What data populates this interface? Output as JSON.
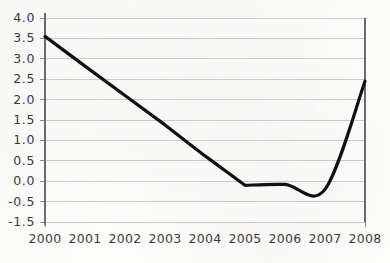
{
  "chart_data": {
    "type": "line",
    "title": "",
    "subtitle": "",
    "xlabel": "",
    "ylabel": "",
    "grid": true,
    "legend": false,
    "legend_position": "none",
    "x": [
      2000,
      2001,
      2002,
      2003,
      2004,
      2005,
      2006,
      2007,
      2008
    ],
    "xtick_labels": [
      "2000",
      "2001",
      "2002",
      "2003",
      "2004",
      "2005",
      "2006",
      "2007",
      "2008"
    ],
    "xlim": [
      2000,
      2008
    ],
    "ylim": [
      -1.5,
      4.0
    ],
    "ytick_values": [
      4.0,
      3.5,
      3.0,
      2.5,
      2.0,
      1.5,
      1.0,
      0.5,
      0.0,
      -0.5,
      -1.5
    ],
    "ytick_labels": [
      "4.0",
      "3.5",
      "3.0",
      "2.5",
      "2.0",
      "1.5",
      "1.0",
      "0.5",
      "0.0",
      "-0.5",
      "-1.5"
    ],
    "series": [
      {
        "name": "",
        "values": [
          3.55,
          2.82,
          2.1,
          1.38,
          0.62,
          -0.1,
          -0.08,
          -0.2,
          2.45
        ],
        "color": "#111111",
        "line_width": 3.2
      }
    ],
    "annotations": []
  },
  "axes": {
    "axis_color": "#6b6b6b",
    "grid_color": "#c9c9c9",
    "tick_color": "#8a8a8a",
    "label_color": "#3b3b3b",
    "background_color": "#fdfdfc"
  }
}
